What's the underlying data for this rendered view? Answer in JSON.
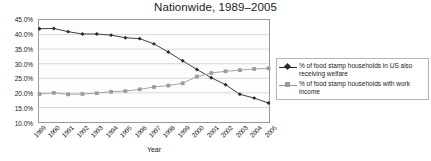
{
  "chart_data": {
    "type": "line",
    "title": "Nationwide, 1989–2005",
    "xlabel": "Year",
    "ylabel": "",
    "ylim": [
      10,
      45
    ],
    "ytick_labels": [
      "45.0%",
      "40.0%",
      "35.0%",
      "30.0%",
      "25.0%",
      "20.0%",
      "15.0%",
      "10.0%"
    ],
    "ytick_values": [
      45,
      40,
      35,
      30,
      25,
      20,
      15,
      10
    ],
    "grid": true,
    "legend_position": "right",
    "categories": [
      "1989",
      "1990",
      "1991",
      "1992",
      "1993",
      "1994",
      "1995",
      "1996",
      "1997",
      "1998",
      "1999",
      "2000",
      "2001",
      "2002",
      "2003",
      "2004",
      "2005"
    ],
    "series": [
      {
        "name": "% of food stamp households in US also receiving welfare",
        "color": "#2b2b2b",
        "marker": "diamond",
        "values": [
          42.0,
          42.1,
          41.0,
          40.2,
          40.2,
          39.8,
          38.9,
          38.6,
          36.8,
          34.0,
          31.0,
          28.0,
          25.2,
          22.8,
          19.5,
          18.2,
          16.5
        ]
      },
      {
        "name": "% of food stamp households with work income",
        "color": "#9b9b9b",
        "marker": "square",
        "values": [
          19.6,
          20.0,
          19.5,
          19.6,
          19.9,
          20.4,
          20.6,
          21.2,
          22.0,
          22.5,
          23.3,
          25.6,
          26.8,
          27.4,
          27.8,
          28.2,
          28.4
        ]
      }
    ]
  },
  "legend": {
    "entries": [
      {
        "label": "% of food stamp households in US also receiving welfare"
      },
      {
        "label": "% of food stamp households with work income"
      }
    ]
  }
}
